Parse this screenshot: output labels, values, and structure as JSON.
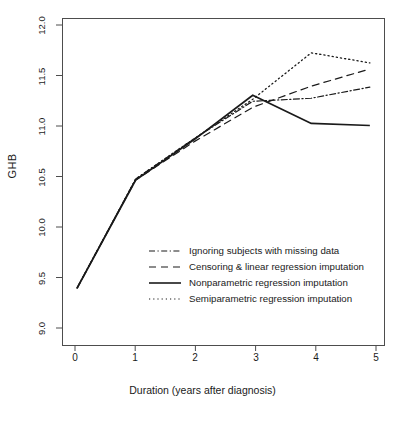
{
  "chart_data": {
    "type": "line",
    "title": "",
    "xlabel": "Duration (years after diagnosis)",
    "ylabel": "GHB",
    "x": [
      0,
      1,
      2,
      3,
      4,
      5
    ],
    "xlim": [
      -0.25,
      5.25
    ],
    "ylim": [
      8.88,
      12.12
    ],
    "xticks": [
      "0",
      "1",
      "2",
      "3",
      "4",
      "5"
    ],
    "yticks": [
      "9.0",
      "9.5",
      "10.0",
      "10.5",
      "11.0",
      "11.5",
      "12.0"
    ],
    "grid": false,
    "legend_position": "center",
    "series": [
      {
        "name": "Ignoring subjects with missing data",
        "linestyle": "dashdot",
        "color": "#1a1a1a",
        "values": [
          9.45,
          10.53,
          10.93,
          11.3,
          11.33,
          11.44
        ]
      },
      {
        "name": "Censoring & linear regression imputation",
        "linestyle": "dashed",
        "color": "#1a1a1a",
        "values": [
          9.45,
          10.52,
          10.9,
          11.24,
          11.45,
          11.62
        ]
      },
      {
        "name": "Nonparametric regression imputation",
        "linestyle": "solid",
        "color": "#1a1a1a",
        "values": [
          9.45,
          10.52,
          10.92,
          11.36,
          11.08,
          11.06
        ]
      },
      {
        "name": "Semiparametric regression imputation",
        "linestyle": "dotted",
        "color": "#1a1a1a",
        "values": [
          9.45,
          10.53,
          10.93,
          11.32,
          11.78,
          11.68
        ]
      }
    ]
  },
  "axes": {
    "y_title": "GHB",
    "x_title": "Duration (years after diagnosis)"
  },
  "legend": {
    "entries": [
      {
        "label": "Ignoring subjects with missing data",
        "style": "dashdot"
      },
      {
        "label": "Censoring & linear regression imputation",
        "style": "dashed"
      },
      {
        "label": "Nonparametric regression imputation",
        "style": "solid"
      },
      {
        "label": "Semiparametric regression imputation",
        "style": "dotted"
      }
    ]
  }
}
